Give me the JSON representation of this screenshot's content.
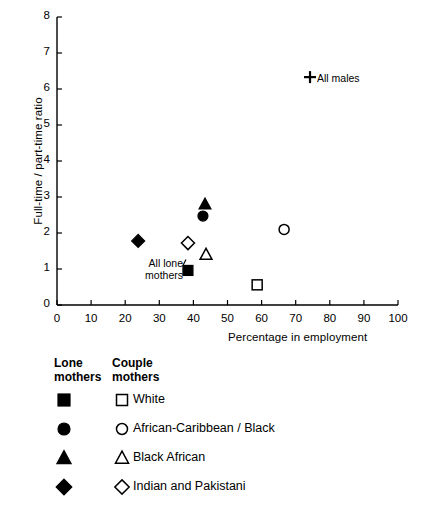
{
  "chart_data": {
    "type": "scatter",
    "title": "",
    "xlabel": "Percentage in employment",
    "ylabel": "Full-time / part-time ratio",
    "xlim": [
      0,
      100
    ],
    "ylim": [
      0,
      8
    ],
    "xticks": [
      "0",
      "10",
      "20",
      "30",
      "40",
      "50",
      "60",
      "70",
      "80",
      "90",
      "100"
    ],
    "yticks": [
      "0",
      "1",
      "2",
      "3",
      "4",
      "5",
      "6",
      "7",
      "8"
    ],
    "grid": false,
    "legend_position": "below-plot",
    "points": [
      {
        "name": "all-males",
        "group": "All",
        "marker": "plus",
        "x": 74.2,
        "y": 6.33,
        "label": "All males"
      },
      {
        "name": "lone-black-african",
        "group": "Lone mothers",
        "marker": "filled-triangle",
        "x": 43.4,
        "y": 2.8,
        "label": ""
      },
      {
        "name": "lone-african-caribbean-black",
        "group": "Lone mothers",
        "marker": "filled-circle",
        "x": 42.8,
        "y": 2.47,
        "label": ""
      },
      {
        "name": "couple-african-caribbean-black",
        "group": "Couple mothers",
        "marker": "open-circle",
        "x": 66.6,
        "y": 2.1,
        "label": ""
      },
      {
        "name": "lone-indian-and-pakistani",
        "group": "Lone mothers",
        "marker": "filled-diamond",
        "x": 23.8,
        "y": 1.78,
        "label": ""
      },
      {
        "name": "couple-indian-and-pakistani",
        "group": "Couple mothers",
        "marker": "open-diamond",
        "x": 38.4,
        "y": 1.72,
        "label": ""
      },
      {
        "name": "couple-black-african",
        "group": "Couple mothers",
        "marker": "open-triangle",
        "x": 43.7,
        "y": 1.4,
        "label": ""
      },
      {
        "name": "all-lone-mothers",
        "group": "Lone mothers",
        "marker": "filled-square",
        "x": 38.4,
        "y": 0.96,
        "label": "All lone\nmothers"
      },
      {
        "name": "couple-white",
        "group": "Couple mothers",
        "marker": "open-square",
        "x": 58.7,
        "y": 0.56,
        "label": ""
      }
    ],
    "annotations": [
      {
        "name": "all-males-annotation",
        "text": "All males",
        "x": 74.2,
        "y": 6.33
      },
      {
        "name": "all-lone-mothers-annotation",
        "text": "All lone mothers",
        "x": 38.4,
        "y": 0.96
      }
    ],
    "legend": {
      "heading_lone": "Lone\nmothers",
      "heading_couple": "Couple\nmothers",
      "rows": [
        {
          "lone_marker": "filled-square",
          "couple_marker": "open-square",
          "label": "White"
        },
        {
          "lone_marker": "filled-circle",
          "couple_marker": "open-circle",
          "label": "African-Caribbean / Black"
        },
        {
          "lone_marker": "filled-triangle",
          "couple_marker": "open-triangle",
          "label": "Black African"
        },
        {
          "lone_marker": "filled-diamond",
          "couple_marker": "open-diamond",
          "label": "Indian and Pakistani"
        }
      ]
    },
    "colors": {
      "background": "#ffffff",
      "foreground": "#000000",
      "marker": "#000000",
      "axis": "#000000"
    }
  },
  "annotation_text": {
    "all_males": "All males",
    "all_lone_mothers_line1": "All lone",
    "all_lone_mothers_line2": "mothers"
  }
}
